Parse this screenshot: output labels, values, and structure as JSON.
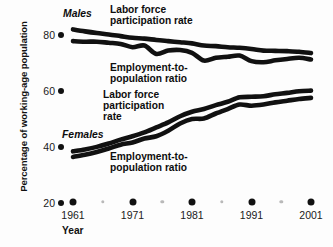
{
  "chart_data": {
    "type": "line",
    "title": "",
    "subtitle": "",
    "xlabel": "Year",
    "ylabel": "Percentage of working-age population",
    "xlim": [
      1961,
      2001
    ],
    "ylim": [
      20,
      80
    ],
    "grid": false,
    "legend_position": "inline-annotations",
    "y_ticks": [
      80,
      60,
      40,
      20
    ],
    "x_ticks_major": [
      1961,
      1971,
      1981,
      1991,
      2001
    ],
    "x_ticks_minor": [
      1966,
      1976,
      1986,
      1996
    ],
    "x": [
      1961,
      1963,
      1965,
      1967,
      1969,
      1971,
      1973,
      1975,
      1977,
      1979,
      1981,
      1983,
      1985,
      1987,
      1989,
      1991,
      1993,
      1995,
      1997,
      1999,
      2001
    ],
    "series": [
      {
        "name": "Males Labor force participation rate",
        "group": "Males",
        "measure": "Labor force participation rate",
        "color": "#111111",
        "values": [
          82.0,
          81.3,
          80.7,
          80.2,
          79.6,
          79.0,
          78.7,
          78.2,
          77.8,
          77.4,
          77.0,
          76.2,
          76.0,
          75.6,
          75.4,
          75.0,
          74.4,
          74.3,
          74.2,
          74.0,
          73.5
        ]
      },
      {
        "name": "Males Employment-to-population ratio",
        "group": "Males",
        "measure": "Employment-to-population ratio",
        "color": "#111111",
        "values": [
          77.8,
          77.6,
          77.6,
          77.2,
          76.8,
          75.6,
          76.2,
          73.2,
          74.4,
          74.6,
          73.6,
          70.8,
          71.8,
          72.2,
          72.6,
          70.6,
          70.2,
          70.9,
          71.4,
          71.8,
          71.2
        ]
      },
      {
        "name": "Females Labor force participation rate",
        "group": "Females",
        "measure": "Labor force participation rate",
        "color": "#111111",
        "values": [
          38.2,
          38.9,
          39.8,
          41.0,
          42.4,
          43.6,
          45.0,
          46.8,
          48.6,
          50.8,
          52.4,
          53.4,
          54.8,
          56.0,
          57.6,
          57.8,
          58.0,
          58.7,
          59.2,
          59.8,
          60.0
        ]
      },
      {
        "name": "Females Employment-to-population ratio",
        "group": "Females",
        "measure": "Employment-to-population ratio",
        "color": "#111111",
        "values": [
          36.2,
          37.0,
          38.0,
          39.2,
          40.6,
          41.4,
          42.8,
          43.6,
          45.6,
          48.2,
          49.8,
          50.0,
          51.8,
          53.4,
          55.0,
          54.6,
          55.0,
          55.8,
          56.4,
          57.0,
          57.4
        ]
      }
    ]
  },
  "axes": {
    "y_title": "Percentage of working-age population",
    "x_title": "Year",
    "y_tick_labels": [
      "80",
      "60",
      "40",
      "20"
    ],
    "x_tick_labels": [
      "1961",
      "1971",
      "1981",
      "1991",
      "2001"
    ]
  },
  "annotations": {
    "males_group": "Males",
    "males_lfp": "Labor force\nparticipation rate",
    "males_epr": "Employment-to-\npopulation ratio",
    "females_group": "Females",
    "females_lfp": "Labor force\nparticipation\nrate",
    "females_epr": "Employment-to-\npopulation ratio"
  },
  "colors": {
    "line": "#111111",
    "tick_major": "#111111",
    "tick_minor": "#b9b9b9",
    "text": "#111111",
    "background": "#fdfdfd"
  }
}
